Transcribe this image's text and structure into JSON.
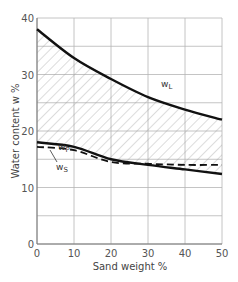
{
  "chart_data": {
    "type": "line",
    "title": "",
    "xlabel": "Sand weight %",
    "ylabel": "Water content  w %",
    "xlim": [
      0,
      50
    ],
    "ylim": [
      0,
      40
    ],
    "x_ticks": [
      0,
      10,
      20,
      30,
      40,
      50
    ],
    "y_ticks": [
      0,
      10,
      20,
      30,
      40
    ],
    "y_minor_grid_step": 5,
    "grid": true,
    "legend": "none (inline curve labels)",
    "annotations": [
      "w_L",
      "w_P",
      "w_S"
    ],
    "hatched_region": "between w_L and w_P (plasticity range)",
    "x": [
      0,
      10,
      20,
      30,
      40,
      50
    ],
    "series": [
      {
        "name": "w_L",
        "label": "wL",
        "style": "solid-thick",
        "values": [
          38.0,
          32.9,
          29.2,
          26.0,
          23.8,
          22.0
        ]
      },
      {
        "name": "w_P",
        "label": "wP",
        "style": "solid-thick",
        "values": [
          18.0,
          17.2,
          15.0,
          14.0,
          13.2,
          12.4
        ]
      },
      {
        "name": "w_S",
        "label": "wS",
        "style": "dashed",
        "values": [
          17.2,
          16.6,
          14.5,
          14.2,
          14.0,
          14.0
        ]
      }
    ]
  },
  "labels": {
    "xlabel": "Sand weight %",
    "ylabel": "Water content  w %",
    "wL": "w",
    "wL_sub": "L",
    "wP": "w",
    "wP_sub": "P",
    "wS": "w",
    "wS_sub": "S"
  }
}
